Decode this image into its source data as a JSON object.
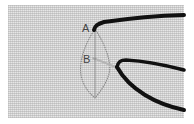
{
  "diagram": {
    "type": "embroidery-stitch-instruction",
    "labels": {
      "a": "A",
      "b": "B"
    },
    "colors": {
      "fabric": "#e6e6e6",
      "thread": "#111111",
      "guide_outline": "#8a8a8a",
      "needle": "#b5b5b5",
      "label": "#444444"
    }
  }
}
